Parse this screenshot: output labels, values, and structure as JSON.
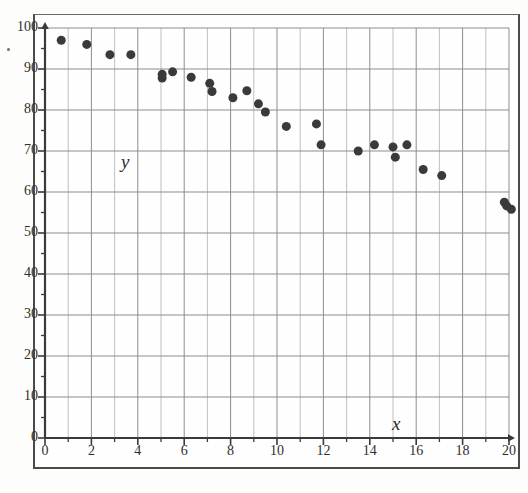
{
  "figure": {
    "label": "scatter-plot-figure",
    "background_color": "#fdfdfc",
    "frame_color": "#4a4a4a"
  },
  "chart_data": {
    "type": "scatter",
    "title": "",
    "xlabel": "x",
    "ylabel": "y",
    "xlim": [
      0,
      20
    ],
    "ylim": [
      0,
      100
    ],
    "grid": true,
    "legend": "none",
    "marker_color": "#3a3a3a",
    "marker_size": 9,
    "x_ticks": [
      0,
      2,
      4,
      6,
      8,
      10,
      12,
      14,
      16,
      18,
      20
    ],
    "x_tick_labels": [
      "0",
      "2",
      "4",
      "6",
      "8",
      "10",
      "12",
      "14",
      "16",
      "18",
      "20"
    ],
    "x_gridline_step": 1,
    "y_ticks": [
      0,
      10,
      20,
      30,
      40,
      50,
      60,
      70,
      80,
      90,
      100
    ],
    "y_tick_labels": [
      "0",
      "10",
      "20",
      "30",
      "40",
      "50",
      "60",
      "70",
      "80",
      "90",
      "100"
    ],
    "y_gridline_step": 10,
    "y_minor_tick_step": 5,
    "points": [
      {
        "x": 0.7,
        "y": 97.0
      },
      {
        "x": 1.8,
        "y": 96.0
      },
      {
        "x": 2.8,
        "y": 93.5
      },
      {
        "x": 3.7,
        "y": 93.5
      },
      {
        "x": 5.05,
        "y": 88.7
      },
      {
        "x": 5.05,
        "y": 87.8
      },
      {
        "x": 5.5,
        "y": 89.3
      },
      {
        "x": 6.3,
        "y": 88.0
      },
      {
        "x": 7.1,
        "y": 86.5
      },
      {
        "x": 7.2,
        "y": 84.5
      },
      {
        "x": 8.1,
        "y": 83.0
      },
      {
        "x": 8.7,
        "y": 84.7
      },
      {
        "x": 9.2,
        "y": 81.5
      },
      {
        "x": 9.5,
        "y": 79.5
      },
      {
        "x": 10.4,
        "y": 76.0
      },
      {
        "x": 11.7,
        "y": 76.6
      },
      {
        "x": 11.9,
        "y": 71.5
      },
      {
        "x": 13.5,
        "y": 70.0
      },
      {
        "x": 14.2,
        "y": 71.5
      },
      {
        "x": 15.0,
        "y": 71.0
      },
      {
        "x": 15.1,
        "y": 68.5
      },
      {
        "x": 15.6,
        "y": 71.5
      },
      {
        "x": 16.3,
        "y": 65.5
      },
      {
        "x": 17.1,
        "y": 64.0
      },
      {
        "x": 19.8,
        "y": 57.5
      },
      {
        "x": 19.9,
        "y": 56.6
      },
      {
        "x": 20.1,
        "y": 55.8
      }
    ]
  }
}
